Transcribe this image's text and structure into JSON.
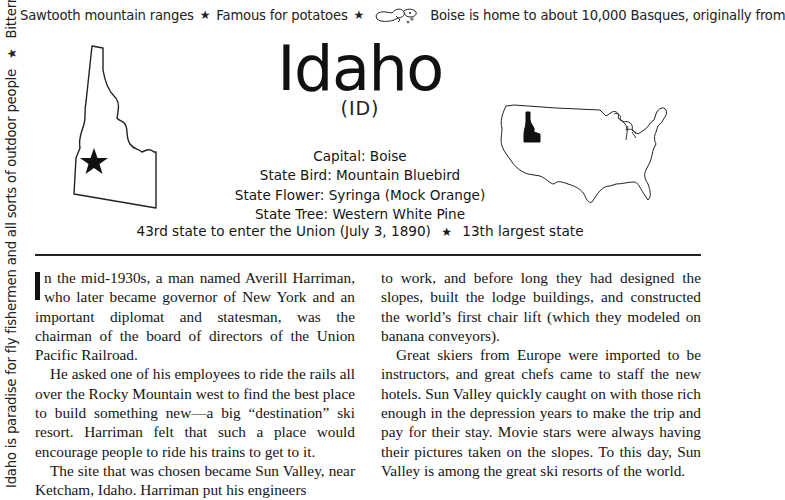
{
  "border": {
    "top": {
      "items": [
        "Sawtooth mountain ranges",
        "Famous for potatoes",
        "Boise is home to about 10,000 Basques, originally from"
      ],
      "separator_icon": "star-icon",
      "doodle_icon": "potato-peeler-doodle-icon"
    },
    "left": {
      "items": [
        "Idaho is paradise for fly fishermen and all sorts of outdoor people",
        "Bitterroot and"
      ],
      "separator_icon": "star-icon"
    }
  },
  "header": {
    "title": "Idaho",
    "abbreviation": "(ID)"
  },
  "facts": {
    "capital": "Capital: Boise",
    "bird": "State Bird: Mountain Bluebird",
    "flower": "State Flower: Syringa (Mock Orange)",
    "tree": "State Tree: Western White Pine"
  },
  "union": {
    "statehood": "43rd state to enter the Union (July 3, 1890)",
    "size": "13th largest state"
  },
  "maps": {
    "state_outline": "idaho-outline-with-capital-star",
    "us_map": "us-map-with-idaho-highlighted"
  },
  "article": {
    "left_column": [
      "n the mid-1930s, a man named Averill Harriman, who later became governor of New York and an important diplomat and statesman, was the chairman of the board of directors of the Union Pacific Railroad.",
      "He asked one of his employees to ride the rails all over the Rocky Mountain west to find the best place to build something new—a big “destination” ski resort. Harriman felt that such a place would encourage people to ride his trains to get to it.",
      "The site that was chosen became Sun Valley, near Ketcham, Idaho. Harriman put his engineers"
    ],
    "right_column": [
      "to work, and before long they had designed the slopes, built the lodge buildings, and constructed the world’s first chair lift (which they modeled on banana conveyors).",
      "Great skiers from Europe were imported to be instructors, and great chefs came to staff the new hotels. Sun Valley quickly caught on with those rich enough in the depression years to make the trip and pay for their stay. Movie stars were always having their pictures taken on the slopes. To this day, Sun Valley is among the great ski resorts of the world."
    ],
    "drop_cap": "I"
  }
}
